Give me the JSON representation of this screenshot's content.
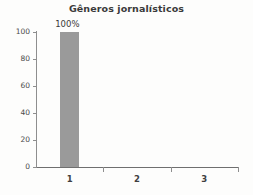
{
  "chart_data": {
    "type": "bar",
    "title_text": "Gêneros jornalísticos",
    "xlabel": "",
    "ylabel": "",
    "categories": [
      "1",
      "2",
      "3"
    ],
    "values": [
      100,
      0,
      0
    ],
    "data_labels": [
      "100%",
      "",
      ""
    ],
    "ylim": [
      0,
      100
    ],
    "yticks": [
      0,
      20,
      40,
      60,
      80,
      100
    ],
    "ytick_labels": [
      "0",
      "20",
      "40",
      "60",
      "80",
      "100"
    ],
    "grid": false,
    "legend": false,
    "bar_color": "#9a9a9a",
    "axis_color": "#8e8e8e",
    "text_color": "#3a3a3a",
    "background": "#fdfdfc"
  }
}
